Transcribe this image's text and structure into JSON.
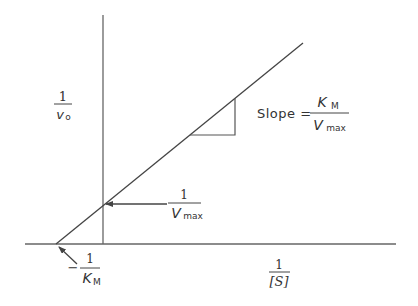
{
  "diagram": {
    "colors": {
      "line": "#555555",
      "text": "#333333",
      "background": "#ffffff"
    },
    "y_axis_label": {
      "numerator": "1",
      "denominator_main": "v",
      "denominator_sub": "o"
    },
    "x_axis_label": {
      "numerator": "1",
      "denominator": "[S]"
    },
    "slope_label": {
      "prefix": "Slope =",
      "numerator_main": "K",
      "numerator_sub": "M",
      "denominator_main": "V",
      "denominator_sub": "max"
    },
    "y_intercept_label": {
      "numerator": "1",
      "denominator_main": "V",
      "denominator_sub": "max"
    },
    "x_intercept_label": {
      "sign": "−",
      "numerator": "1",
      "denominator_main": "K",
      "denominator_sub": "M"
    }
  }
}
